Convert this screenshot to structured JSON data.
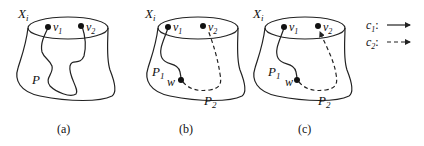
{
  "figure": {
    "panels": [
      {
        "id": "a",
        "caption": "(a)",
        "set_label": "X",
        "set_sub": "i",
        "vertices": [
          {
            "name": "v",
            "sub": "1"
          },
          {
            "name": "v",
            "sub": "2"
          }
        ],
        "paths": [
          {
            "name": "P",
            "sub": "",
            "style": "solid"
          }
        ]
      },
      {
        "id": "b",
        "caption": "(b)",
        "set_label": "X",
        "set_sub": "i",
        "vertices": [
          {
            "name": "v",
            "sub": "1"
          },
          {
            "name": "v",
            "sub": "2"
          },
          {
            "name": "w",
            "sub": ""
          }
        ],
        "paths": [
          {
            "name": "P",
            "sub": "1",
            "style": "solid"
          },
          {
            "name": "P",
            "sub": "2",
            "style": "dashed"
          }
        ]
      },
      {
        "id": "c",
        "caption": "(c)",
        "set_label": "X",
        "set_sub": "i",
        "vertices": [
          {
            "name": "v",
            "sub": "1"
          },
          {
            "name": "v",
            "sub": "2"
          },
          {
            "name": "w",
            "sub": ""
          }
        ],
        "paths": [
          {
            "name": "P",
            "sub": "1",
            "style": "solid"
          },
          {
            "name": "P",
            "sub": "2",
            "style": "dashed"
          }
        ]
      }
    ],
    "legend": [
      {
        "name": "c",
        "sub": "1",
        "sep": ":",
        "style": "solid-arrow"
      },
      {
        "name": "c",
        "sub": "2",
        "sep": ":",
        "style": "dashed-arrow"
      }
    ]
  }
}
